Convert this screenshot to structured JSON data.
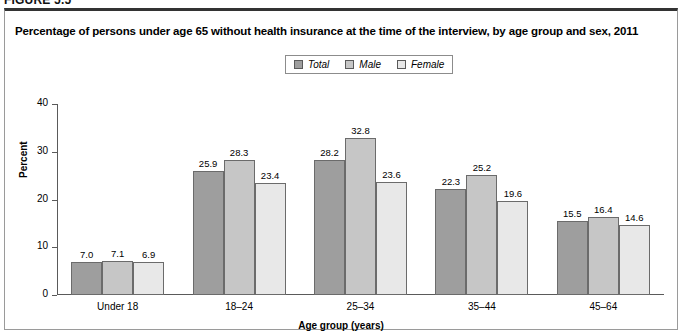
{
  "figure": {
    "number_label": "FIGURE 5.5"
  },
  "panel": {
    "title": "Percentage of persons under age 65 without health insurance at the time of the interview, by age group and sex, 2011"
  },
  "legend": {
    "position": "top-center",
    "items": [
      {
        "label": "Total",
        "color": "#9e9e9e"
      },
      {
        "label": "Male",
        "color": "#c6c6c6"
      },
      {
        "label": "Female",
        "color": "#e8e8e8"
      }
    ]
  },
  "chart_data": {
    "type": "bar",
    "title": "Percentage of persons under age 65 without health insurance at the time of the interview, by age group and sex, 2011",
    "xlabel": "Age group (years)",
    "ylabel": "Percent",
    "ylim": [
      0,
      40
    ],
    "yticks": [
      0,
      10,
      20,
      30,
      40
    ],
    "grid": false,
    "categories": [
      "Under 18",
      "18–24",
      "25–34",
      "35–44",
      "45–64"
    ],
    "series": [
      {
        "name": "Total",
        "color": "#9e9e9e",
        "values": [
          7.0,
          25.9,
          28.2,
          22.3,
          15.5
        ]
      },
      {
        "name": "Male",
        "color": "#c6c6c6",
        "values": [
          7.1,
          28.3,
          32.8,
          25.2,
          16.4
        ]
      },
      {
        "name": "Female",
        "color": "#e8e8e8",
        "values": [
          6.9,
          23.4,
          23.6,
          19.6,
          14.6
        ]
      }
    ],
    "value_labels": [
      [
        "7.0",
        "7.1",
        "6.9"
      ],
      [
        "25.9",
        "28.3",
        "23.4"
      ],
      [
        "28.2",
        "32.8",
        "23.6"
      ],
      [
        "22.3",
        "25.2",
        "19.6"
      ],
      [
        "15.5",
        "16.4",
        "14.6"
      ]
    ]
  }
}
